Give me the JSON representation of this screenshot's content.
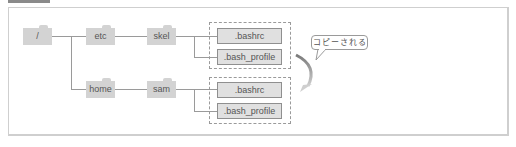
{
  "header": {
    "label": ""
  },
  "tree": {
    "root": {
      "label": "/"
    },
    "etc": {
      "label": "etc"
    },
    "skel": {
      "label": "skel"
    },
    "home": {
      "label": "home"
    },
    "sam": {
      "label": "sam"
    },
    "skel_files": [
      {
        "label": ".bashrc"
      },
      {
        "label": ".bash_profile"
      }
    ],
    "sam_files": [
      {
        "label": ".bashrc"
      },
      {
        "label": ".bash_profile"
      }
    ]
  },
  "callout": {
    "text": "コピーされる"
  },
  "colors": {
    "folder": "#d3d3d3",
    "file": "#e0e0e0",
    "line": "#9a9a9a",
    "arrow": "#8c8c8c"
  }
}
